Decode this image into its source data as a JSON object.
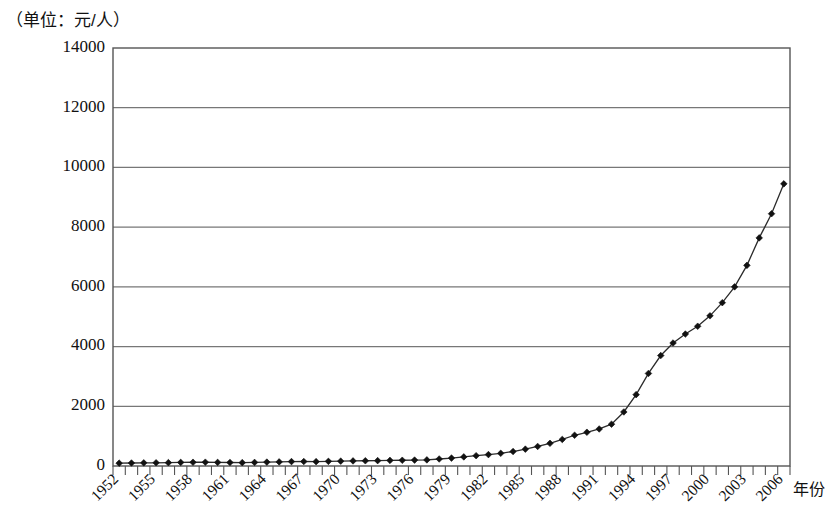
{
  "unit_label": "（单位：元/人）",
  "axis_title_x": "年份",
  "chart_data": {
    "type": "line",
    "title": "",
    "subtitle": "",
    "xlabel": "年份",
    "ylabel": "（单位：元/人）",
    "ylim": [
      0,
      14000
    ],
    "ytick_values": [
      0,
      2000,
      4000,
      6000,
      8000,
      10000,
      12000,
      14000
    ],
    "ytick_labels": [
      "0",
      "2000",
      "4000",
      "6000",
      "8000",
      "10000",
      "12000",
      "14000"
    ],
    "grid": true,
    "grid_axis": "y",
    "legend": false,
    "marker": "diamond",
    "x_tick_label_rotation": -45,
    "x_label_step": 3,
    "xtick_labels": [
      "1952",
      "1955",
      "1958",
      "1961",
      "1964",
      "1967",
      "1970",
      "1973",
      "1976",
      "1979",
      "1982",
      "1985",
      "1988",
      "1991",
      "1994",
      "1997",
      "2000",
      "2003",
      "2006"
    ],
    "x": [
      1952,
      1953,
      1954,
      1955,
      1956,
      1957,
      1958,
      1959,
      1960,
      1961,
      1962,
      1963,
      1964,
      1965,
      1966,
      1967,
      1968,
      1969,
      1970,
      1971,
      1972,
      1973,
      1974,
      1975,
      1976,
      1977,
      1978,
      1979,
      1980,
      1981,
      1982,
      1983,
      1984,
      1985,
      1986,
      1987,
      1988,
      1989,
      1990,
      1991,
      1992,
      1993,
      1994,
      1995,
      1996,
      1997,
      1998,
      1999,
      2000,
      2001,
      2002,
      2003,
      2004,
      2005,
      2006
    ],
    "values": [
      60,
      70,
      75,
      80,
      90,
      100,
      110,
      120,
      110,
      115,
      110,
      120,
      130,
      140,
      150,
      150,
      145,
      155,
      165,
      170,
      175,
      180,
      185,
      190,
      195,
      200,
      230,
      260,
      300,
      340,
      380,
      420,
      480,
      560,
      650,
      750,
      880,
      1020,
      1120,
      1230,
      1390,
      1800,
      2380,
      3090,
      3680,
      4100,
      4400,
      4650,
      5000,
      5440,
      5960,
      6680,
      7600,
      8400,
      9400
    ]
  },
  "chart_pixels": {
    "plot_left": 113,
    "plot_right": 790,
    "plot_top": 48,
    "plot_bottom": 466
  },
  "chart_values_rendered": [
    95,
    100,
    105,
    108,
    112,
    120,
    125,
    128,
    120,
    118,
    112,
    120,
    130,
    138,
    148,
    150,
    146,
    155,
    162,
    170,
    175,
    180,
    188,
    192,
    198,
    205,
    235,
    265,
    305,
    345,
    382,
    425,
    485,
    565,
    655,
    760,
    890,
    1030,
    1130,
    1240,
    1400,
    1810,
    2390,
    3100,
    3700,
    4120,
    4420,
    4680,
    5030,
    5470,
    6000,
    6720,
    7640,
    8450,
    9450
  ]
}
